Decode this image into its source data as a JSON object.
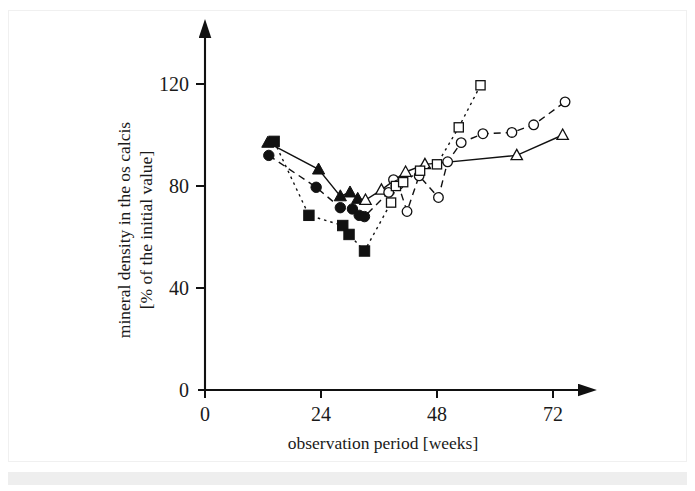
{
  "chart_data": {
    "type": "scatter",
    "title": "",
    "xlabel": "observation period [weeks]",
    "ylabel": "mineral density in the os calcis [% of the initial value]",
    "ylabel_line1": "mineral density in the os calcis",
    "ylabel_line2": "[% of the initial value]",
    "xlim": [
      0,
      77
    ],
    "ylim": [
      0,
      128
    ],
    "xticks": [
      0,
      24,
      48,
      72
    ],
    "xticklabels": [
      "0",
      "24",
      "48",
      "72"
    ],
    "yticks": [
      0,
      40,
      80,
      120
    ],
    "yticklabels": [
      "0",
      "40",
      "80",
      "120"
    ],
    "grid": false,
    "legend": "none",
    "axis_style": "arrow-spines",
    "colors": {
      "ink": "#111111",
      "background": "#ffffff",
      "border": "#f0f0f0",
      "band": "#eeeeee"
    },
    "series": [
      {
        "name": "triangle-series",
        "marker": "triangle",
        "line_style": "solid",
        "points": [
          {
            "x": 13.0,
            "y": 97.0,
            "filled": true
          },
          {
            "x": 23.5,
            "y": 86.5,
            "filled": true
          },
          {
            "x": 28.0,
            "y": 76.0,
            "filled": true
          },
          {
            "x": 30.0,
            "y": 77.5,
            "filled": true
          },
          {
            "x": 31.6,
            "y": 75.0,
            "filled": true
          },
          {
            "x": 33.2,
            "y": 74.5,
            "filled": false
          },
          {
            "x": 36.5,
            "y": 78.5,
            "filled": false
          },
          {
            "x": 41.5,
            "y": 85.5,
            "filled": false
          },
          {
            "x": 45.5,
            "y": 88.5,
            "filled": false
          },
          {
            "x": 64.5,
            "y": 92.0,
            "filled": false
          },
          {
            "x": 74.0,
            "y": 100.0,
            "filled": false
          }
        ]
      },
      {
        "name": "circle-series",
        "marker": "circle",
        "line_style": "dashed",
        "points": [
          {
            "x": 13.2,
            "y": 92.0,
            "filled": true
          },
          {
            "x": 23.0,
            "y": 79.5,
            "filled": true
          },
          {
            "x": 28.0,
            "y": 71.5,
            "filled": true
          },
          {
            "x": 30.5,
            "y": 71.0,
            "filled": true
          },
          {
            "x": 31.9,
            "y": 68.5,
            "filled": true
          },
          {
            "x": 33.0,
            "y": 68.0,
            "filled": true
          },
          {
            "x": 38.0,
            "y": 77.5,
            "filled": false
          },
          {
            "x": 39.0,
            "y": 82.5,
            "filled": false
          },
          {
            "x": 40.0,
            "y": 80.5,
            "filled": false
          },
          {
            "x": 41.8,
            "y": 70.0,
            "filled": false
          },
          {
            "x": 44.3,
            "y": 84.0,
            "filled": false
          },
          {
            "x": 48.3,
            "y": 75.5,
            "filled": false
          },
          {
            "x": 50.2,
            "y": 89.5,
            "filled": false
          },
          {
            "x": 53.0,
            "y": 97.0,
            "filled": false
          },
          {
            "x": 57.5,
            "y": 100.5,
            "filled": false
          },
          {
            "x": 63.5,
            "y": 101.0,
            "filled": false
          },
          {
            "x": 68.0,
            "y": 104.0,
            "filled": false
          },
          {
            "x": 74.5,
            "y": 113.0,
            "filled": false
          }
        ]
      },
      {
        "name": "square-series",
        "marker": "square",
        "line_style": "dotted",
        "points": [
          {
            "x": 14.3,
            "y": 97.5,
            "filled": true
          },
          {
            "x": 21.5,
            "y": 68.5,
            "filled": true
          },
          {
            "x": 28.5,
            "y": 64.5,
            "filled": true
          },
          {
            "x": 29.8,
            "y": 61.0,
            "filled": true
          },
          {
            "x": 33.0,
            "y": 54.5,
            "filled": true
          },
          {
            "x": 38.5,
            "y": 73.5,
            "filled": false
          },
          {
            "x": 39.5,
            "y": 80.0,
            "filled": false
          },
          {
            "x": 41.0,
            "y": 81.5,
            "filled": false
          },
          {
            "x": 44.5,
            "y": 86.0,
            "filled": false
          },
          {
            "x": 48.0,
            "y": 88.5,
            "filled": false
          },
          {
            "x": 52.5,
            "y": 103.0,
            "filled": false
          },
          {
            "x": 57.0,
            "y": 119.5,
            "filled": false
          }
        ]
      }
    ]
  }
}
